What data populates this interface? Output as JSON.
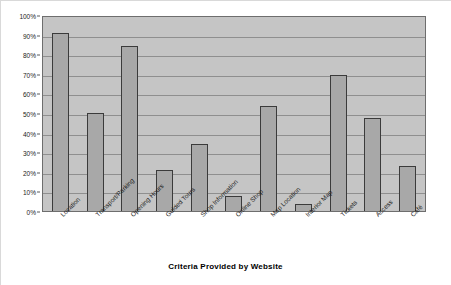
{
  "chart_data": {
    "type": "bar",
    "title": "",
    "xlabel": "Criteria Provided by Website",
    "ylabel": "",
    "ylim": [
      0,
      100
    ],
    "grid": true,
    "legend": "none",
    "categories": [
      "Location",
      "Transport/Parking",
      "Opening Hours",
      "Guided Tours",
      "Shop Information",
      "Online Shop",
      "Map Location",
      "Interior Map",
      "Tickets",
      "Access",
      "Café"
    ],
    "values": [
      91,
      50,
      84,
      21,
      34,
      7.5,
      53.5,
      3.5,
      69.5,
      47.5,
      23
    ],
    "y_ticks": [
      0,
      10,
      20,
      30,
      40,
      50,
      60,
      70,
      80,
      90,
      100
    ],
    "y_tick_labels": [
      "0%",
      "10%",
      "20%",
      "30%",
      "40%",
      "50%",
      "60%",
      "70%",
      "80%",
      "90%",
      "100%"
    ],
    "colors": {
      "bar_fill": "#a8a8a8",
      "bar_border": "#3b3b3b",
      "plot_background": "#c5c5c5",
      "gridline": "#8f8f8f",
      "axis_text": "#1a1a1a",
      "figure_background": "#ffffff"
    }
  }
}
